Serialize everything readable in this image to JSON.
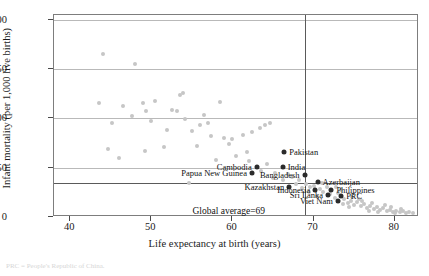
{
  "chart_data": {
    "type": "scatter",
    "title": "",
    "xlabel": "Life expectancy at birth (years)",
    "ylabel": "Infant mortality (per 1,000 live births)",
    "xlim": [
      38,
      83
    ],
    "ylim": [
      0,
      205
    ],
    "xticks": [
      40,
      50,
      60,
      70,
      80
    ],
    "yticks": [
      0,
      50,
      100,
      150,
      200
    ],
    "grid": true,
    "legend": "none",
    "reference_lines": [
      {
        "axis": "y",
        "value": 34,
        "label": "Global average=34",
        "orientation": "vertical-text"
      },
      {
        "axis": "x",
        "value": 69,
        "label": "Global average=69",
        "orientation": "horizontal-text"
      }
    ],
    "highlighted_points": [
      {
        "name": "Pakistan",
        "x": 66.4,
        "y": 65.8,
        "label_side": "right"
      },
      {
        "name": "India",
        "x": 66.2,
        "y": 51.0,
        "label_side": "right"
      },
      {
        "name": "Cambodia",
        "x": 63.0,
        "y": 51.0,
        "label_side": "left"
      },
      {
        "name": "Papua New Guinea",
        "x": 62.4,
        "y": 44.2,
        "label_side": "left"
      },
      {
        "name": "Bangladesh",
        "x": 68.9,
        "y": 43.0,
        "label_side": "left"
      },
      {
        "name": "Azerbaijan",
        "x": 70.5,
        "y": 35.5,
        "label_side": "right"
      },
      {
        "name": "Kazakhstan",
        "x": 67.0,
        "y": 30.5,
        "label_side": "left"
      },
      {
        "name": "Indonesia",
        "x": 70.2,
        "y": 27.0,
        "label_side": "left"
      },
      {
        "name": "Philippines",
        "x": 72.2,
        "y": 27.5,
        "label_side": "right"
      },
      {
        "name": "Sri Lanka",
        "x": 71.8,
        "y": 22.0,
        "label_side": "left"
      },
      {
        "name": "PRC",
        "x": 73.4,
        "y": 21.5,
        "label_side": "right"
      },
      {
        "name": "Viet Nam",
        "x": 73.0,
        "y": 16.0,
        "label_side": "left"
      }
    ],
    "points": [
      {
        "x": 44.0,
        "y": 165.0
      },
      {
        "x": 48.0,
        "y": 155.0
      },
      {
        "x": 43.6,
        "y": 116.0
      },
      {
        "x": 46.5,
        "y": 112.5
      },
      {
        "x": 49.0,
        "y": 116.0
      },
      {
        "x": 50.4,
        "y": 118.0
      },
      {
        "x": 53.5,
        "y": 124.0
      },
      {
        "x": 53.9,
        "y": 125.5
      },
      {
        "x": 58.5,
        "y": 117.0
      },
      {
        "x": 47.6,
        "y": 103.0
      },
      {
        "x": 49.3,
        "y": 108.0
      },
      {
        "x": 52.6,
        "y": 109.0
      },
      {
        "x": 53.2,
        "y": 108.0
      },
      {
        "x": 56.5,
        "y": 104.0
      },
      {
        "x": 50.0,
        "y": 97.0
      },
      {
        "x": 51.9,
        "y": 88.0
      },
      {
        "x": 55.0,
        "y": 87.0
      },
      {
        "x": 57.4,
        "y": 82.0
      },
      {
        "x": 59.0,
        "y": 80.5
      },
      {
        "x": 60.0,
        "y": 79.0
      },
      {
        "x": 61.3,
        "y": 83.0
      },
      {
        "x": 62.4,
        "y": 86.0
      },
      {
        "x": 63.4,
        "y": 90.0
      },
      {
        "x": 64.0,
        "y": 93.0
      },
      {
        "x": 64.6,
        "y": 95.0
      },
      {
        "x": 51.6,
        "y": 71.0
      },
      {
        "x": 44.6,
        "y": 69.0
      },
      {
        "x": 46.0,
        "y": 60.0
      },
      {
        "x": 49.2,
        "y": 67.0
      },
      {
        "x": 55.6,
        "y": 72.0
      },
      {
        "x": 60.4,
        "y": 62.0
      },
      {
        "x": 63.5,
        "y": 47.0
      },
      {
        "x": 54.6,
        "y": 34.0
      },
      {
        "x": 58.0,
        "y": 58.0
      },
      {
        "x": 62.0,
        "y": 57.0
      },
      {
        "x": 64.2,
        "y": 54.0
      },
      {
        "x": 65.3,
        "y": 45.0
      },
      {
        "x": 66.8,
        "y": 44.0
      },
      {
        "x": 67.4,
        "y": 41.0
      },
      {
        "x": 68.2,
        "y": 38.0
      },
      {
        "x": 69.1,
        "y": 33.0
      },
      {
        "x": 69.6,
        "y": 30.0
      },
      {
        "x": 70.0,
        "y": 31.5
      },
      {
        "x": 70.8,
        "y": 28.0
      },
      {
        "x": 71.2,
        "y": 25.0
      },
      {
        "x": 71.6,
        "y": 30.0
      },
      {
        "x": 72.0,
        "y": 23.0
      },
      {
        "x": 72.6,
        "y": 19.5
      },
      {
        "x": 73.0,
        "y": 24.0
      },
      {
        "x": 73.8,
        "y": 18.0
      },
      {
        "x": 74.2,
        "y": 14.0
      },
      {
        "x": 74.6,
        "y": 16.5
      },
      {
        "x": 75.0,
        "y": 12.5
      },
      {
        "x": 75.4,
        "y": 15.0
      },
      {
        "x": 75.8,
        "y": 11.0
      },
      {
        "x": 76.2,
        "y": 13.0
      },
      {
        "x": 76.6,
        "y": 9.5
      },
      {
        "x": 77.0,
        "y": 11.5
      },
      {
        "x": 77.4,
        "y": 8.5
      },
      {
        "x": 77.8,
        "y": 10.0
      },
      {
        "x": 78.2,
        "y": 7.5
      },
      {
        "x": 78.6,
        "y": 9.0
      },
      {
        "x": 79.0,
        "y": 6.5
      },
      {
        "x": 79.4,
        "y": 7.5
      },
      {
        "x": 79.8,
        "y": 5.5
      },
      {
        "x": 80.2,
        "y": 6.5
      },
      {
        "x": 80.6,
        "y": 5.0
      },
      {
        "x": 81.0,
        "y": 5.8
      },
      {
        "x": 81.4,
        "y": 4.5
      },
      {
        "x": 81.8,
        "y": 5.2
      },
      {
        "x": 82.2,
        "y": 4.0
      },
      {
        "x": 74.8,
        "y": 20.0
      },
      {
        "x": 75.6,
        "y": 18.5
      },
      {
        "x": 76.0,
        "y": 16.0
      },
      {
        "x": 73.4,
        "y": 27.5
      },
      {
        "x": 72.8,
        "y": 30.5
      },
      {
        "x": 71.0,
        "y": 34.5
      },
      {
        "x": 70.4,
        "y": 21.0
      },
      {
        "x": 69.4,
        "y": 25.5
      },
      {
        "x": 68.6,
        "y": 29.0
      },
      {
        "x": 67.8,
        "y": 33.5
      },
      {
        "x": 66.2,
        "y": 38.0
      },
      {
        "x": 65.0,
        "y": 40.0
      },
      {
        "x": 61.8,
        "y": 66.0
      },
      {
        "x": 59.6,
        "y": 74.0
      },
      {
        "x": 56.0,
        "y": 93.0
      },
      {
        "x": 57.0,
        "y": 95.0
      },
      {
        "x": 54.2,
        "y": 99.0
      },
      {
        "x": 45.2,
        "y": 95.0
      },
      {
        "x": 77.2,
        "y": 14.5
      },
      {
        "x": 78.8,
        "y": 12.0
      },
      {
        "x": 79.6,
        "y": 10.5
      },
      {
        "x": 80.8,
        "y": 8.0
      },
      {
        "x": 73.6,
        "y": 13.0
      },
      {
        "x": 74.4,
        "y": 10.0
      },
      {
        "x": 76.8,
        "y": 6.0
      },
      {
        "x": 78.0,
        "y": 4.8
      },
      {
        "x": 80.0,
        "y": 3.8
      }
    ]
  },
  "footnote": "PRC = People's Republic of China."
}
